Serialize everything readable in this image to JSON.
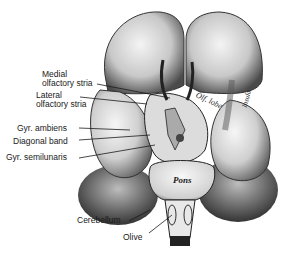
{
  "figure": {
    "colors": {
      "background": "#ffffff",
      "ink": "#1a1a1a",
      "shade_dark": "#3a3a3a",
      "shade_mid": "#9a9a9a",
      "shade_light": "#e6e6e6"
    }
  },
  "labels": {
    "medial_olfactory_stria_1": "Medial",
    "medial_olfactory_stria_2": "olfactory stria",
    "lateral_olfactory_stria_1": "Lateral",
    "lateral_olfactory_stria_2": "olfactory stria",
    "gyr_ambiens": "Gyr. ambiens",
    "diagonal_band": "Diagonal band",
    "gyr_semilunaris": "Gyr. semilunaris",
    "cerebellum": "Cerebellum",
    "olive": "Olive"
  },
  "inline_labels": {
    "olf_lobe": "Olf. lobe",
    "insula": "Insula",
    "pons": "Pons"
  }
}
